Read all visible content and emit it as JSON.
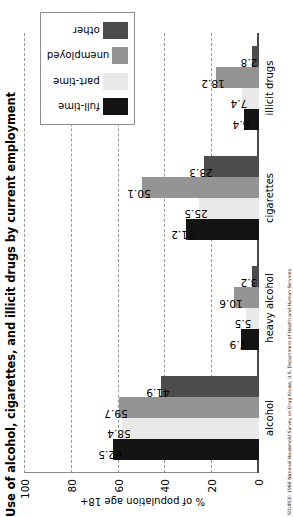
{
  "chart_data": {
    "type": "bar",
    "title": "Use of alcohol, cigarettes, and illicit drugs by current employment",
    "xlabel": "",
    "ylabel": "% of population age 18+",
    "ylim": [
      0,
      100
    ],
    "yticks": [
      0,
      20,
      40,
      60,
      80,
      100
    ],
    "grid": true,
    "legend_position": "top-right",
    "categories": [
      "alcohol",
      "heavy alcohol",
      "cigarettes",
      "illicit drugs"
    ],
    "series": [
      {
        "name": "full-time",
        "color": "#141414",
        "values": [
          62.5,
          7.9,
          31.2,
          6.4
        ]
      },
      {
        "name": "part-time",
        "color": "#e9e9e9",
        "values": [
          58.4,
          5.5,
          25.5,
          7.4
        ]
      },
      {
        "name": "unemployed",
        "color": "#949494",
        "values": [
          59.7,
          10.6,
          50.1,
          18.2
        ]
      },
      {
        "name": "other",
        "color": "#4c4c4c",
        "values": [
          41.9,
          3.2,
          23.3,
          2.8
        ]
      }
    ],
    "source": "SOURCE: 1998 National Household Survey on Drug Abuse, U.S. Department of Health and Human Services"
  }
}
